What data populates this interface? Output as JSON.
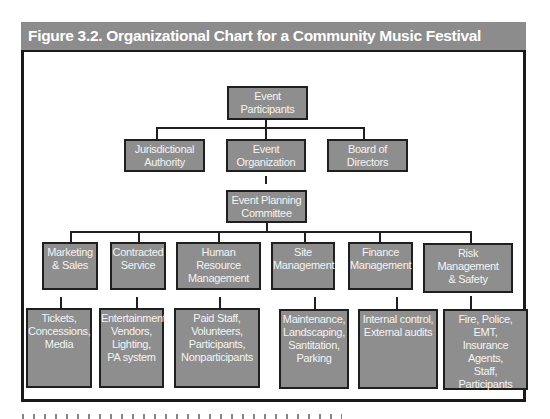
{
  "figure": {
    "title": "Figure 3.2. Organizational Chart for a Community Music Festival",
    "colors": {
      "title_bar": "#8c8c8c",
      "box_fill": "#8e8e8e",
      "box_border": "#1f1f1f",
      "box_text": "#f4f4f4",
      "frame": "#1a1a1a"
    }
  },
  "chart": {
    "root": {
      "label": "Event\nParticipants"
    },
    "level1": [
      {
        "label": "Jurisdictional\nAuthority"
      },
      {
        "label": "Event\nOrganization"
      },
      {
        "label": "Board of\nDirectors"
      }
    ],
    "committee": {
      "label": "Event Planning\nCommittee"
    },
    "departments": [
      {
        "label": "Marketing\n& Sales",
        "details": "Tickets,\nConcessions,\nMedia"
      },
      {
        "label": "Contracted\nService",
        "details": "Entertainment,\nVendors,\nLighting,\nPA system"
      },
      {
        "label": "Human Resource\nManagement",
        "details": "Paid Staff,\nVolunteers,\nParticipants,\nNonparticipants"
      },
      {
        "label": "Site\nManagement",
        "details": "Maintenance,\nLandscaping,\nSantitation,\nParking"
      },
      {
        "label": "Finance\nManagement",
        "details": "Internal control,\nExternal audits"
      },
      {
        "label": "Risk\nManagement\n& Safety",
        "details": "Fire, Police,\nEMT,\nInsurance Agents,\nStaff,\nParticipants"
      }
    ]
  }
}
